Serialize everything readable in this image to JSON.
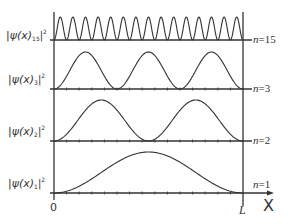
{
  "diagram": {
    "title": "",
    "x_axis": {
      "label": "X",
      "start_label": "0",
      "end_label": "L"
    },
    "panels": [
      {
        "n": 15,
        "ylabel_main": "|ψ(x)",
        "ylabel_sub": "15",
        "ylabel_sup": "2",
        "nlabel_var": "n",
        "nlabel_eq": "=15"
      },
      {
        "n": 3,
        "ylabel_main": "|ψ(x)",
        "ylabel_sub": "3",
        "ylabel_sup": "2",
        "nlabel_var": "n",
        "nlabel_eq": "=3"
      },
      {
        "n": 2,
        "ylabel_main": "|ψ(x)",
        "ylabel_sub": "2",
        "ylabel_sup": "2",
        "nlabel_var": "n",
        "nlabel_eq": "=2"
      },
      {
        "n": 1,
        "ylabel_main": "|ψ(x)",
        "ylabel_sub": "1",
        "ylabel_sup": "2",
        "nlabel_var": "n",
        "nlabel_eq": "=1"
      }
    ],
    "colors": {
      "line": "#333333",
      "background": "#ffffff"
    }
  }
}
